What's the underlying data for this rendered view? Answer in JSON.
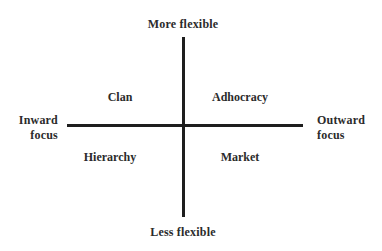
{
  "diagram": {
    "type": "quadrant",
    "axes": {
      "vertical": {
        "top_label": "More flexible",
        "bottom_label": "Less flexible"
      },
      "horizontal": {
        "left_label_line1": "Inward",
        "left_label_line2": "focus",
        "right_label_line1": "Outward",
        "right_label_line2": "focus"
      }
    },
    "quadrants": {
      "top_left": "Clan",
      "top_right": "Adhocracy",
      "bottom_left": "Hierarchy",
      "bottom_right": "Market"
    },
    "colors": {
      "axis": "#1e1e1e",
      "text": "#2b2b2b",
      "background": "#ffffff"
    }
  }
}
